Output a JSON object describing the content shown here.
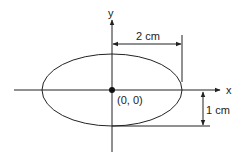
{
  "diagram": {
    "axes": {
      "x_label": "x",
      "y_label": "y"
    },
    "origin_label": "(0, 0)",
    "ellipse": {
      "center": [
        0,
        0
      ],
      "semi_major_cm": 2,
      "semi_minor_cm": 1
    },
    "dimensions": {
      "horizontal_label": "2 cm",
      "vertical_label": "1 cm"
    },
    "colors": {
      "stroke": "#222222",
      "background": "#ffffff"
    }
  }
}
